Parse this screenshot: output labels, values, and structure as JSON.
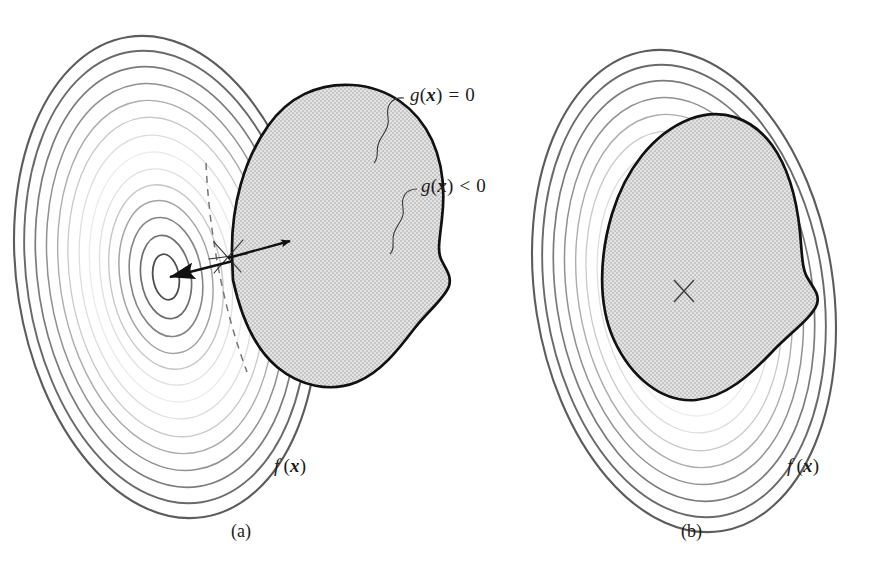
{
  "figure": {
    "kind": "contour-diagram",
    "background_color": "#ffffff",
    "width": 892,
    "height": 584
  },
  "colors": {
    "ink": "#1b1b1b",
    "contour_dark": "#5e5e5e",
    "contour_mid": "#8d8d8d",
    "contour_light": "#c4c4c4",
    "contour_faint": "#e2e2e2",
    "contour_white": "#ffffff",
    "feasible_fill": "#d9d9d9",
    "feasible_edge": "#111111",
    "leader_line": "#3a3a3a",
    "dashed_line": "#6a6a6a",
    "arrow": "#111111"
  },
  "panels": [
    {
      "id": "a",
      "caption": "(a)",
      "caption_pos": {
        "x": 231,
        "y": 521
      },
      "objective_label": {
        "name": "f-of-x",
        "fn": "f",
        "open": "(",
        "var": "x",
        "close": ")",
        "pos": {
          "x": 274,
          "y": 466
        }
      },
      "constraint_labels": [
        {
          "name": "g-equals-zero",
          "fn": "g",
          "open": "(",
          "var": "x",
          "close": ")",
          "op": "=",
          "rhs": "0",
          "pos": {
            "x": 410,
            "y": 95
          }
        },
        {
          "name": "g-less-than-zero",
          "fn": "g",
          "open": "(",
          "var": "x",
          "close": ")",
          "op": "<",
          "rhs": "0",
          "pos": {
            "x": 421,
            "y": 186
          }
        }
      ],
      "optimum": {
        "x": 166,
        "y": 277,
        "marker": "arrowhead"
      },
      "tangent_point": {
        "x": 228,
        "y": 258
      },
      "gradient_arrow": {
        "from_x": 228,
        "from_y": 258,
        "to_x": 295,
        "to_y": 240
      },
      "has_dashed_tangent": true,
      "has_double_arrow": true,
      "feasible_region_contains_optimum": false
    },
    {
      "id": "b",
      "caption": "(b)",
      "caption_pos": {
        "x": 681,
        "y": 521
      },
      "objective_label": {
        "name": "f-of-x",
        "fn": "f",
        "open": "(",
        "var": "x",
        "close": ")",
        "pos": {
          "x": 787,
          "y": 466
        }
      },
      "constraint_labels": [],
      "optimum": {
        "x": 684,
        "y": 291,
        "marker": "crossed-ellipse"
      },
      "has_dashed_tangent": false,
      "has_double_arrow": false,
      "feasible_region_contains_optimum": true
    }
  ],
  "contour_levels": {
    "count_panel_a": 14,
    "count_panel_b": 14,
    "note": "Nested closed level curves of the objective, darkest at outermost and innermost rings, faint in between."
  }
}
